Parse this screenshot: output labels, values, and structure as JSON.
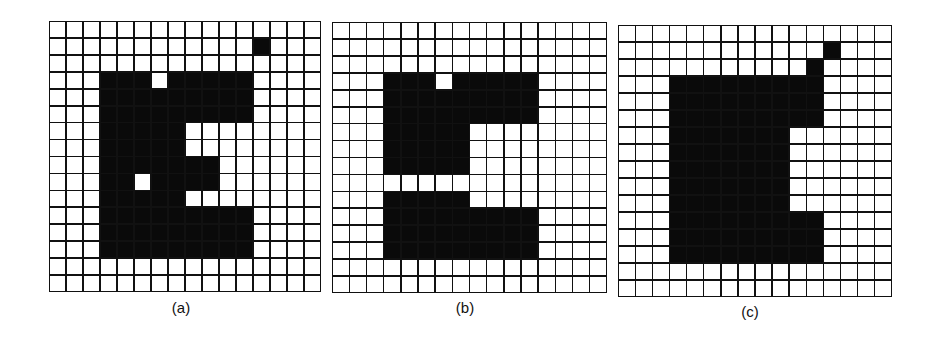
{
  "figure": {
    "panels": [
      {
        "label": "(a)",
        "rows": 16,
        "cols": 16,
        "grid": [
          "0000000000000000",
          "0000000000001000",
          "0000000000000000",
          "0001110111110000",
          "0001111111110000",
          "0001111111110000",
          "0001111100000000",
          "0001111100000000",
          "0001111111000000",
          "0001101111000000",
          "0001111100000000",
          "0001111111110000",
          "0001111111110000",
          "0001111111110000",
          "0000000000000000",
          "0000000000000000"
        ]
      },
      {
        "label": "(b)",
        "rows": 16,
        "cols": 16,
        "grid": [
          "0000000000000000",
          "0000000000000000",
          "0000000000000000",
          "0001110111110000",
          "0001111111110000",
          "0001111111110000",
          "0001111100000000",
          "0001111100000000",
          "0001111100000000",
          "0000000000000000",
          "0001111100000000",
          "0001111111110000",
          "0001111111110000",
          "0001111111110000",
          "0000000000000000",
          "0000000000000000"
        ]
      },
      {
        "label": "(c)",
        "rows": 16,
        "cols": 16,
        "grid": [
          "0000000000000000",
          "0000000000001000",
          "0000000000010000",
          "0001111111110000",
          "0001111111110000",
          "0001111111110000",
          "0001111111000000",
          "0001111111000000",
          "0001111111000000",
          "0001111111000000",
          "0001111111000000",
          "0001111111110000",
          "0001111111110000",
          "0001111111110000",
          "0000000000000000",
          "0000000000000000"
        ]
      }
    ],
    "colors": {
      "foreground": "#0a0a0a",
      "background": "#ffffff",
      "gridline": "#111111"
    }
  }
}
